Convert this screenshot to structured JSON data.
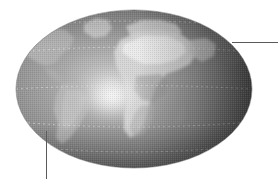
{
  "figure": {
    "background_color": "#ffffff",
    "width": 278,
    "height": 179
  },
  "globe": {
    "name": "earth-globe",
    "shape": "ellipse",
    "center_x": 134,
    "center_y": 89,
    "radius_x": 118,
    "radius_y": 79,
    "style": "grayscale halftone satellite view",
    "ocean_color": "#8e8e8e",
    "land_color": "#a8a8a8",
    "highlight_color": "#f2f2f2",
    "shadow_color": "#3b3b3b",
    "outline_color": "#6b6b6b",
    "specular_highlight": {
      "x": 112,
      "y": 96,
      "radius": 34
    },
    "terminator_shadow_side": "right",
    "gridlines": {
      "visible": true,
      "style": "dotted",
      "color": "#d8d8d8",
      "latitudes": [
        26,
        52,
        89,
        122,
        146
      ]
    },
    "landmasses": [
      {
        "name": "north-america",
        "label": "North America"
      },
      {
        "name": "south-america",
        "label": "South America"
      },
      {
        "name": "africa",
        "label": "Africa"
      },
      {
        "name": "europe",
        "label": "Europe"
      },
      {
        "name": "greenland",
        "label": "Greenland"
      },
      {
        "name": "arabia",
        "label": "Arabian Peninsula"
      }
    ]
  },
  "callouts": [
    {
      "name": "leader-line-right",
      "orientation": "horizontal",
      "from_x": 232,
      "from_y": 42,
      "to_x": 278,
      "to_y": 42,
      "color": "#5a5a5a"
    },
    {
      "name": "leader-line-bottom",
      "orientation": "vertical",
      "from_x": 46,
      "from_y": 131,
      "to_x": 46,
      "to_y": 179,
      "color": "#5a5a5a"
    }
  ]
}
